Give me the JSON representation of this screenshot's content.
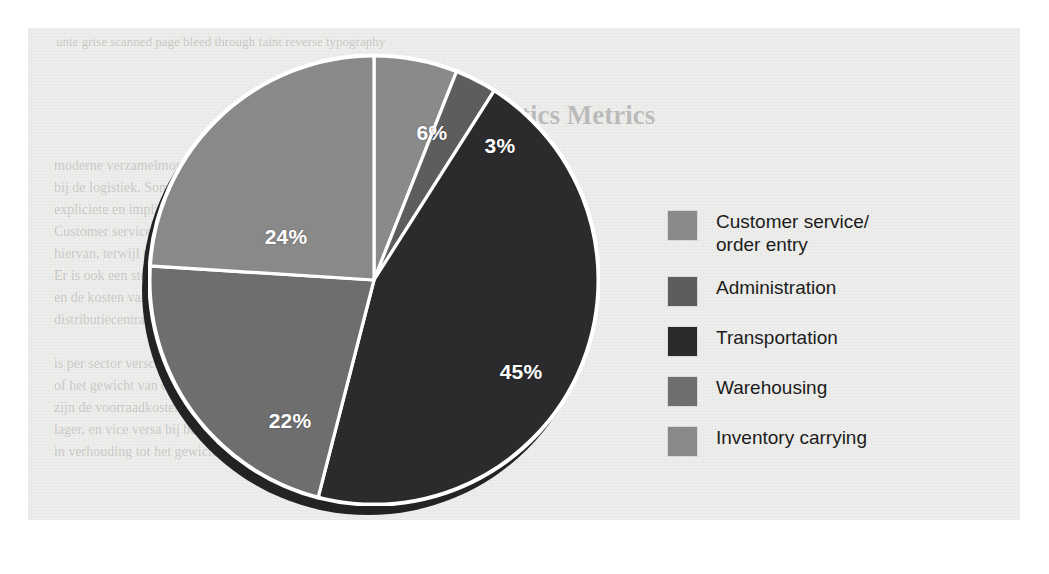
{
  "figure": {
    "background_color": "#eeeeec",
    "page_color": "#ffffff"
  },
  "chart_data": {
    "type": "pie",
    "title": "",
    "subtitle": "",
    "xlabel": "",
    "ylabel": "",
    "legend_position": "right",
    "grid": false,
    "start_angle_deg": 0,
    "direction": "clockwise",
    "units": "percent",
    "total": 100,
    "categories": [
      "Customer service/order entry",
      "Administration",
      "Transportation",
      "Warehousing",
      "Inventory carrying"
    ],
    "values": [
      6,
      3,
      45,
      22,
      24
    ],
    "labels": [
      "6%",
      "3%",
      "45%",
      "22%",
      "24%"
    ],
    "colors": [
      "#8a8a8a",
      "#5d5d5d",
      "#2b2b2d",
      "#6e6e6e",
      "#898989"
    ],
    "slices": [
      {
        "name": "Customer service/order entry",
        "value": 6,
        "label": "6%",
        "color": "#8a8a8a",
        "label_x": 404,
        "label_y": 105
      },
      {
        "name": "Administration",
        "value": 3,
        "label": "3%",
        "color": "#5d5d5d",
        "label_x": 472,
        "label_y": 118
      },
      {
        "name": "Transportation",
        "value": 45,
        "label": "45%",
        "color": "#2b2b2d",
        "label_x": 493,
        "label_y": 344
      },
      {
        "name": "Warehousing",
        "value": 22,
        "label": "22%",
        "color": "#6e6e6e",
        "label_x": 262,
        "label_y": 393
      },
      {
        "name": "Inventory carrying",
        "value": 24,
        "label": "24%",
        "color": "#898989",
        "label_x": 258,
        "label_y": 209
      }
    ],
    "separator_color": "#ffffff",
    "shadow_color": "#232325"
  },
  "legend": {
    "items": [
      {
        "label": "Customer service/\norder entry",
        "label_line1": "Customer service/",
        "label_line2": "order entry",
        "color": "#8a8a8a"
      },
      {
        "label": "Administration",
        "color": "#5d5d5d"
      },
      {
        "label": "Transportation",
        "color": "#2b2b2d"
      },
      {
        "label": "Warehousing",
        "color": "#6e6e6e"
      },
      {
        "label": "Inventory carrying",
        "color": "#898989"
      }
    ]
  },
  "ghost_text": {
    "top_line": "unte grise scanned page bleed through faint reverse typography",
    "heading": "Logistics Metrics",
    "lines": [
      "moderne verzamelmoment nodig aan dit overzicht van de kosten",
      "bij de logistiek. Sommige kosten zijn zichtbaar, andere niet.",
      "expliciete en impliciete kosten van distributie in kaart",
      "Customer service en order entry vormen een klein deel",
      "hiervan, terwijl transport verreweg de grootste post is.",
      "Er is ook een sterke samenhang tussen de voorraadkosten",
      "en de kosten van magazijnruimte in het netwerk van",
      "distributiecentra. De verhouding tussen deze posten",
      "is per sector verschillend en hangt samen met de waarde",
      "of het gewicht van de goederen. Bij hoogwaardige producten",
      "zijn de voorraadkosten relatief hoog en de transportkosten",
      "lager, en vice versa bij bulkgoederen met lage waarde",
      "in verhouding tot het gewicht. Onderstaande figuur toont de"
    ]
  }
}
